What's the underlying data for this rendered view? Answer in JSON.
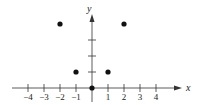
{
  "chart_data": {
    "type": "scatter",
    "title": "",
    "xlabel": "x",
    "ylabel": "y",
    "xlim": [
      -4.5,
      4.5
    ],
    "ylim": [
      -0.5,
      4.5
    ],
    "x_ticks": [
      -4,
      -3,
      -2,
      -1,
      1,
      2,
      3,
      4
    ],
    "x_tick_labels": [
      "−4",
      "−3",
      "−2",
      "−1",
      "1",
      "2",
      "3",
      "4"
    ],
    "y_ticks": [
      1,
      2,
      3
    ],
    "grid": false,
    "legend": null,
    "points": [
      {
        "x": -2,
        "y": 4
      },
      {
        "x": -1,
        "y": 1
      },
      {
        "x": 0,
        "y": 0
      },
      {
        "x": 1,
        "y": 1
      },
      {
        "x": 2,
        "y": 4
      }
    ],
    "color": "#111111"
  }
}
